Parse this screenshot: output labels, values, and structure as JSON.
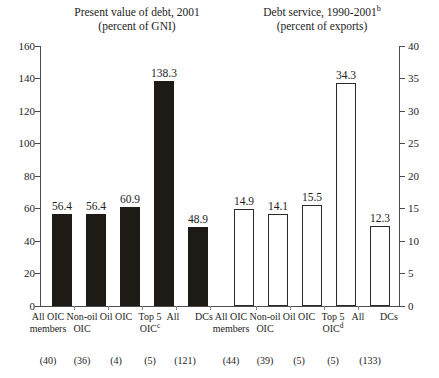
{
  "chart_data": {
    "type": "bar",
    "panels": [
      {
        "key": "present_value_of_debt",
        "title_line1": "Present value of debt, 2001",
        "title_line2": "(percent of GNI)",
        "title_superscript": "",
        "ylabel": "",
        "ylim": [
          0,
          160
        ],
        "yticks": [
          0,
          20,
          40,
          60,
          80,
          100,
          120,
          140,
          160
        ],
        "axis_side": "left",
        "bar_style": "filled",
        "categories": [
          {
            "line1": "All OIC",
            "line2": "members",
            "sup": "",
            "count": "(40)"
          },
          {
            "line1": "Non-oil",
            "line2": "OIC",
            "sup": "",
            "count": "(36)"
          },
          {
            "line1": "Oil OIC",
            "line2": "",
            "sup": "",
            "count": "(4)"
          },
          {
            "line1": "Top 5",
            "line2": "OIC",
            "sup": "c",
            "count": "(5)"
          },
          {
            "line1": "All",
            "line2": "",
            "sup": "",
            "count": "(121)"
          },
          {
            "line1": "DCs",
            "line2": "",
            "sup": "",
            "count": ""
          }
        ],
        "values": [
          56.4,
          56.4,
          60.9,
          138.3,
          48.9
        ],
        "value_labels": [
          "56.4",
          "56.4",
          "60.9",
          "138.3",
          "48.9"
        ]
      },
      {
        "key": "debt_service",
        "title_line1": "Debt service, 1990-2001",
        "title_line2": "(percent of exports)",
        "title_superscript": "b",
        "ylabel": "",
        "ylim": [
          0,
          40
        ],
        "yticks": [
          0,
          5,
          10,
          15,
          20,
          25,
          30,
          35,
          40
        ],
        "axis_side": "right",
        "bar_style": "hollow",
        "categories": [
          {
            "line1": "All OIC",
            "line2": "members",
            "sup": "",
            "count": "(44)"
          },
          {
            "line1": "Non-oil",
            "line2": "OIC",
            "sup": "",
            "count": "(39)"
          },
          {
            "line1": "Oil OIC",
            "line2": "",
            "sup": "",
            "count": "(5)"
          },
          {
            "line1": "Top 5",
            "line2": "OIC",
            "sup": "d",
            "count": "(5)"
          },
          {
            "line1": "All",
            "line2": "",
            "sup": "",
            "count": "(133)"
          },
          {
            "line1": "DCs",
            "line2": "",
            "sup": "",
            "count": ""
          }
        ],
        "values": [
          14.9,
          14.1,
          15.5,
          34.3,
          12.3
        ],
        "value_labels": [
          "14.9",
          "14.1",
          "15.5",
          "34.3",
          "12.3"
        ]
      }
    ],
    "grid": false,
    "legend": "none",
    "colors": {
      "bar_filled": "#1e1a15",
      "bar_hollow_fill": "#ffffff",
      "bar_outline": "#2a2a2a",
      "axis": "#4c4c4c",
      "text": "#1d1d1d",
      "background": "#ffffff"
    }
  },
  "axis_left": {
    "labels": [
      "160",
      "140",
      "120",
      "100",
      "80",
      "60",
      "40",
      "20",
      "0"
    ]
  },
  "axis_right": {
    "labels": [
      "40",
      "35",
      "30",
      "25",
      "20",
      "15",
      "10",
      "5",
      "0"
    ]
  }
}
